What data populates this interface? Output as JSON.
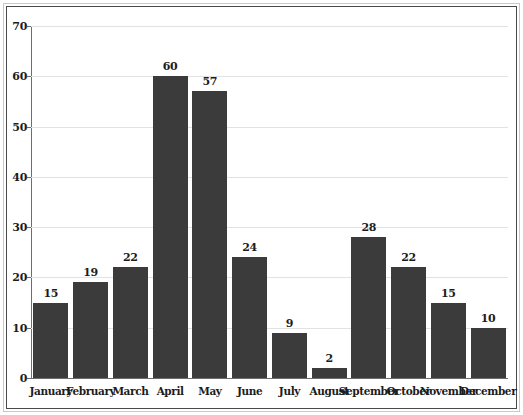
{
  "chart_data": {
    "type": "bar",
    "title": "",
    "subtitle": "",
    "xlabel": "",
    "ylabel": "",
    "categories": [
      "January",
      "February",
      "March",
      "April",
      "May",
      "June",
      "July",
      "August",
      "September",
      "October",
      "November",
      "December"
    ],
    "values": [
      15,
      19,
      22,
      60,
      57,
      24,
      9,
      2,
      28,
      22,
      15,
      10
    ],
    "data_labels": [
      "15",
      "19",
      "22",
      "60",
      "57",
      "24",
      "9",
      "2",
      "28",
      "22",
      "15",
      "10"
    ],
    "ylim": [
      0,
      70
    ],
    "ytick_labels": [
      "0",
      "10",
      "20",
      "30",
      "40",
      "50",
      "60",
      "70"
    ],
    "ytick_values": [
      0,
      10,
      20,
      30,
      40,
      50,
      60,
      70
    ],
    "grid": true,
    "grid_axis": "y",
    "legend": false,
    "legend_position": "none",
    "bar_color": "#3b3b3b",
    "grid_color": "#e2e2e2",
    "axis_color": "#6d6d6d",
    "text_color": "#1c1c1c",
    "background_color": "#ffffff",
    "frame_outer_color": "#c9c9c9",
    "frame_inner_color": "#4a4a4a"
  }
}
